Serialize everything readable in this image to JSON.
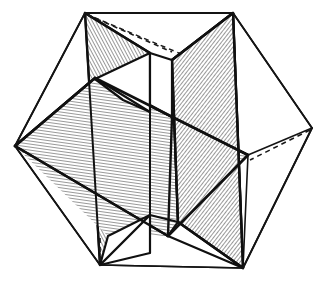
{
  "figure": {
    "kind": "geometric-line-drawing",
    "background_color": "#ffffff",
    "ink_color": "#141414",
    "hatch_color": "#1c1c1c",
    "canvas": {
      "width": 325,
      "height": 281
    },
    "style": {
      "outer_edge_width": 1.6,
      "inner_edge_width": 2.4,
      "hidden_edge_width": 1.5,
      "hidden_edge_dash": "5 4",
      "hatch_line_width": 0.9,
      "hatch_spacing": 3.0
    },
    "vertices": {
      "outline_top_left": {
        "x": 85,
        "y": 13
      },
      "outline_top_right": {
        "x": 233,
        "y": 13
      },
      "outline_right": {
        "x": 312,
        "y": 128
      },
      "outline_bottom_right": {
        "x": 243,
        "y": 268
      },
      "outline_bottom_left": {
        "x": 100,
        "y": 265
      },
      "outline_left": {
        "x": 15,
        "y": 146
      },
      "inner_upper_left": {
        "x": 95,
        "y": 78
      },
      "inner_upper_right": {
        "x": 248,
        "y": 155
      },
      "inner_lower_left": {
        "x": 108,
        "y": 236
      },
      "inner_lower_right": {
        "x": 235,
        "y": 80
      },
      "center": {
        "x": 164,
        "y": 140
      }
    },
    "rectangles": [
      {
        "name": "golden-rectangle-horizontal",
        "hatch_angle_deg": 8,
        "points": "15,146 95,78 248,155 168,236"
      },
      {
        "name": "golden-rectangle-vertical-left",
        "hatch_angle_deg": 62,
        "points": "85,13 170,60 183,222 100,265"
      },
      {
        "name": "golden-rectangle-vertical-right",
        "hatch_angle_deg": 128,
        "points": "233,13 243,268 148,205 145,63"
      }
    ],
    "outline_polygon": "85,13 233,13 312,128 243,268 100,265 15,146",
    "hidden_edges": [
      "85,13 233,75",
      "312,128 225,185",
      "100,238 100,265"
    ],
    "labels": []
  }
}
